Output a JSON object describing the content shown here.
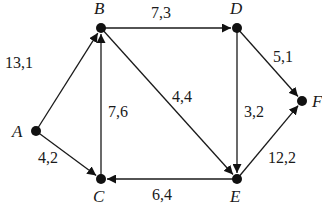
{
  "diagram": {
    "type": "directed-network",
    "nodes": [
      {
        "id": "A",
        "label": "A",
        "x": 36,
        "y": 131,
        "lx": 12,
        "ly": 137
      },
      {
        "id": "B",
        "label": "B",
        "x": 101,
        "y": 28,
        "lx": 94,
        "ly": 14
      },
      {
        "id": "C",
        "label": "C",
        "x": 101,
        "y": 179,
        "lx": 93,
        "ly": 202
      },
      {
        "id": "D",
        "label": "D",
        "x": 237,
        "y": 28,
        "lx": 230,
        "ly": 14
      },
      {
        "id": "E",
        "label": "E",
        "x": 237,
        "y": 179,
        "lx": 230,
        "ly": 202
      },
      {
        "id": "F",
        "label": "F",
        "x": 302,
        "y": 101,
        "lx": 312,
        "ly": 107
      }
    ],
    "edges": [
      {
        "from": "A",
        "to": "B",
        "label": "13,1",
        "lx": 5,
        "ly": 68
      },
      {
        "from": "A",
        "to": "C",
        "label": "4,2",
        "lx": 38,
        "ly": 163
      },
      {
        "from": "B",
        "to": "D",
        "label": "7,3",
        "lx": 151,
        "ly": 18
      },
      {
        "from": "B",
        "to": "E",
        "label": "4,4",
        "lx": 172,
        "ly": 102
      },
      {
        "from": "C",
        "to": "B",
        "label": "7,6",
        "lx": 108,
        "ly": 117
      },
      {
        "from": "D",
        "to": "E",
        "label": "3,2",
        "lx": 244,
        "ly": 117
      },
      {
        "from": "D",
        "to": "F",
        "label": "5,1",
        "lx": 273,
        "ly": 62
      },
      {
        "from": "E",
        "to": "C",
        "label": "6,4",
        "lx": 152,
        "ly": 200
      },
      {
        "from": "E",
        "to": "F",
        "label": "12,2",
        "lx": 268,
        "ly": 163
      }
    ]
  }
}
